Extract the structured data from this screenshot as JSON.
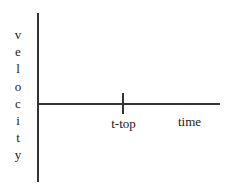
{
  "chart_data": {
    "type": "line",
    "title": "",
    "subtitle": "",
    "xlabel": "time",
    "ylabel": "velocity",
    "ylabel_letters": [
      "v",
      "e",
      "l",
      "o",
      "c",
      "i",
      "t",
      "y"
    ],
    "series": [],
    "x_ticks": [
      {
        "label": "t-top",
        "position_px": 123
      }
    ],
    "y_ticks": [],
    "grid": false,
    "legend": false,
    "axis_color": "#333333",
    "text_color": "#1a1a1a",
    "background_color": "#ffffff"
  },
  "figure": {
    "y_axis_name": "velocity-axis",
    "x_axis_name": "time-axis",
    "tick_name": "t-top-tick"
  }
}
